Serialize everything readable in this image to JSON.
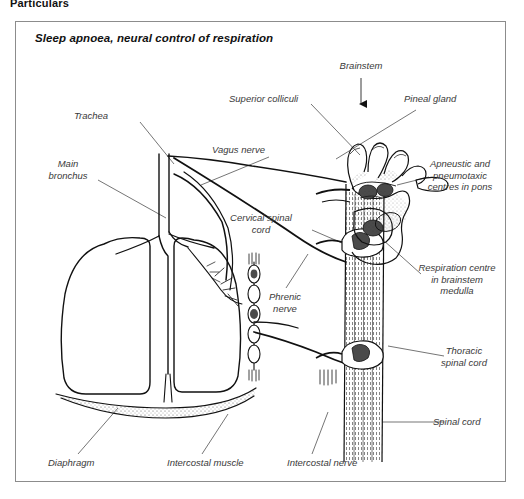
{
  "page": {
    "header_text": "Particulars"
  },
  "figure": {
    "title": "Sleep apnoea, neural control of respiration",
    "border_color": "#8c8c8c",
    "ink_color": "#1a1a1a",
    "label_color": "#3a3a3a",
    "shade_color": "#4a4a4a",
    "background": "#ffffff"
  },
  "labels": [
    {
      "id": "brainstem",
      "text": "Brainstem",
      "x": 342,
      "y": 44,
      "align": "center",
      "leader": "arrow-down"
    },
    {
      "id": "superior-colliculi",
      "text": "Superior colliculi",
      "x": 228,
      "y": 76,
      "align": "left",
      "leader": "line"
    },
    {
      "id": "pineal-gland",
      "text": "Pineal gland",
      "x": 403,
      "y": 76,
      "align": "left",
      "leader": "line"
    },
    {
      "id": "trachea",
      "text": "Trachea",
      "x": 73,
      "y": 93,
      "align": "left",
      "leader": "line"
    },
    {
      "id": "vagus-nerve",
      "text": "Vagus nerve",
      "x": 211,
      "y": 127,
      "align": "left",
      "leader": "line"
    },
    {
      "id": "apneustic-pneumotaxic",
      "text": "Apneustic and\npneumotaxic\ncentres in pons",
      "x": 416,
      "y": 141,
      "align": "left",
      "leader": "line"
    },
    {
      "id": "main-bronchus",
      "text": "Main\nbronchus",
      "x": 48,
      "y": 141,
      "align": "left",
      "leader": "line"
    },
    {
      "id": "cervical-spinal-cord",
      "text": "Cervical spinal\ncord",
      "x": 231,
      "y": 195,
      "align": "left",
      "leader": "line"
    },
    {
      "id": "respiration-centre",
      "text": "Respiration centre\nin brainstem\nmedulla",
      "x": 408,
      "y": 245,
      "align": "left",
      "leader": "line"
    },
    {
      "id": "phrenic-nerve",
      "text": "Phrenic\nnerve",
      "x": 264,
      "y": 274,
      "align": "left",
      "leader": "line"
    },
    {
      "id": "thoracic-spinal-cord",
      "text": "Thoracic\nspinal cord",
      "x": 432,
      "y": 328,
      "align": "left",
      "leader": "line"
    },
    {
      "id": "spinal-cord",
      "text": "Spinal cord",
      "x": 432,
      "y": 398,
      "align": "left",
      "leader": "line"
    },
    {
      "id": "diaphragm",
      "text": "Diaphragm",
      "x": 47,
      "y": 440,
      "align": "left",
      "leader": "line"
    },
    {
      "id": "intercostal-muscle",
      "text": "Intercostal muscle",
      "x": 166,
      "y": 440,
      "align": "left",
      "leader": "line"
    },
    {
      "id": "intercostal-nerve",
      "text": "Intercostal nerve",
      "x": 286,
      "y": 440,
      "align": "left",
      "leader": "line"
    }
  ],
  "anatomy": {
    "parts": [
      "trachea",
      "main-bronchus-left",
      "main-bronchus-right",
      "lung-left",
      "lung-right",
      "diaphragm",
      "vagus-nerve",
      "phrenic-nerve",
      "intercostal-nerve",
      "sympathetic-chain",
      "spinal-cord",
      "brainstem",
      "superior-colliculi",
      "pineal-gland",
      "pons",
      "medulla"
    ]
  }
}
